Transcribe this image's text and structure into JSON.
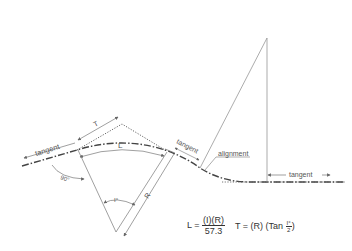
{
  "diagram": {
    "labels": {
      "tangent_left": "tangent",
      "tangent_mid": "tangent",
      "tangent_right": "tangent",
      "alignment": "alignment",
      "T": "T",
      "L": "L",
      "R": "R",
      "I": "I°",
      "angle_90": "90°"
    },
    "formulas": {
      "length": {
        "lhs": "L =",
        "numerator": "(I)(R)",
        "denominator": "57.3"
      },
      "tangent": {
        "lhs": "T = (R) (Tan",
        "numerator": "I°",
        "denominator": "2",
        "close": ")"
      }
    },
    "colors": {
      "line": "#777777",
      "text": "#555555"
    }
  }
}
